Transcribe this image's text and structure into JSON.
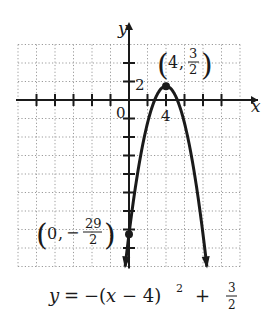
{
  "chart_data": {
    "type": "line",
    "title": "",
    "equation": "y = −(x − 4)² + 3/2",
    "xlabel": "x",
    "ylabel": "y",
    "grid_step": 2,
    "xlim": [
      -12,
      12
    ],
    "ylim": [
      -18,
      6
    ],
    "tick_labels": {
      "origin": "0",
      "x": "4",
      "y": "2"
    },
    "grid": true,
    "series": [
      {
        "name": "y = -(x-4)^2 + 3/2",
        "function": "-(x-4)^2 + 1.5",
        "x": [
          -0.42,
          0,
          1,
          2,
          3,
          4,
          5,
          6,
          7,
          8,
          8.42
        ],
        "y": [
          -18,
          -14.5,
          -7.5,
          -2.5,
          0.5,
          1.5,
          0.5,
          -2.5,
          -7.5,
          -14.5,
          -18
        ]
      }
    ],
    "points": [
      {
        "name": "vertex",
        "x": 4,
        "y": 1.5,
        "label_x": "4",
        "label_y_num": "3",
        "label_y_den": "2"
      },
      {
        "name": "y-intercept",
        "x": 0,
        "y": -14.5,
        "label_x": "0",
        "label_y_sign": "−",
        "label_y_num": "29",
        "label_y_den": "2"
      }
    ],
    "colors": {
      "curve": "#1a1a1a",
      "grid": "#9a9a9a",
      "axis": "#1a1a1a"
    }
  },
  "caption": {
    "lhs": "y",
    "eq": "=",
    "body": "−(x − 4)",
    "exp": "2",
    "plus": "+",
    "frac_num": "3",
    "frac_den": "2"
  }
}
